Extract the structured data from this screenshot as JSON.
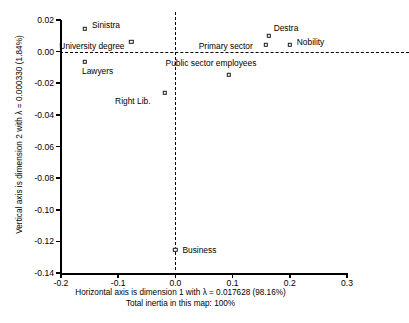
{
  "chart_data": {
    "type": "scatter",
    "title": "",
    "xlabel": "Horizontal axis is dimension 1 with λ = 0.017628 (98.16%)",
    "xlabel2": "Total inertia in this map: 100%",
    "ylabel": "Vertical axis is dimension 2 with λ = 0.000330 (1.84%)",
    "xlim": [
      -0.2,
      0.3
    ],
    "ylim": [
      -0.14,
      0.02
    ],
    "xticks": [
      "-0.2",
      "-0.1",
      "0.0",
      "0.1",
      "0.2",
      "0.3"
    ],
    "xtickvals": [
      -0.2,
      -0.1,
      0.0,
      0.1,
      0.2,
      0.3
    ],
    "yticks": [
      "0.02",
      "0.00",
      "-0.02",
      "-0.04",
      "-0.06",
      "-0.08",
      "-0.10",
      "-0.12",
      "-0.14"
    ],
    "ytickvals": [
      0.02,
      0.0,
      -0.02,
      -0.04,
      -0.06,
      -0.08,
      -0.1,
      -0.12,
      -0.14
    ],
    "grid": false,
    "reference_lines": {
      "horizontal": 0.0,
      "vertical": 0.0,
      "style": "dashed"
    },
    "legend": "none",
    "marker": "open-square",
    "points": [
      {
        "label": "Sinistra",
        "x": -0.158,
        "y": 0.0145,
        "label_dx": 7,
        "label_dy": -4
      },
      {
        "label": "University degree",
        "x": -0.077,
        "y": 0.0063,
        "label_dx": -72,
        "label_dy": 4
      },
      {
        "label": "Lawyers",
        "x": -0.158,
        "y": -0.0065,
        "label_dx": -3,
        "label_dy": 9
      },
      {
        "label": "Right Lib.",
        "x": -0.018,
        "y": -0.0262,
        "label_dx": -50,
        "label_dy": 8
      },
      {
        "label": "Business",
        "x": 0.0,
        "y": -0.1255,
        "label_dx": 7,
        "label_dy": 0
      },
      {
        "label": "Public sector employees",
        "x": 0.093,
        "y": -0.0145,
        "label_dx": -63,
        "label_dy": -12
      },
      {
        "label": "Primary sector",
        "x": 0.158,
        "y": 0.0045,
        "label_dx": -67,
        "label_dy": 1
      },
      {
        "label": "Destra",
        "x": 0.163,
        "y": 0.01,
        "label_dx": 5,
        "label_dy": -8
      },
      {
        "label": "Nobility",
        "x": 0.2,
        "y": 0.0045,
        "label_dx": 7,
        "label_dy": -3
      }
    ]
  }
}
